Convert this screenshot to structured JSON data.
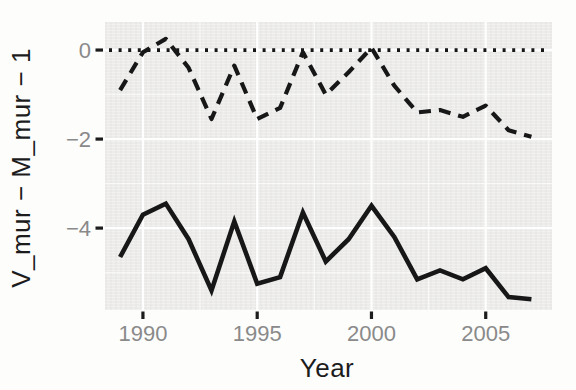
{
  "chart_data": {
    "type": "line",
    "title": "",
    "xlabel": "Year",
    "ylabel": "V_mur − M_mur − 1",
    "legend": "none",
    "grid": "major and minor white gridlines on light gray panel",
    "x": [
      1989,
      1990,
      1991,
      1992,
      1993,
      1994,
      1995,
      1996,
      1997,
      1998,
      1999,
      2000,
      2001,
      2002,
      2003,
      2004,
      2005,
      2006,
      2007
    ],
    "series": [
      {
        "name": "upper-dashed-series",
        "line_style": "dashed",
        "color": "#171717",
        "values": [
          -0.9,
          -0.05,
          0.25,
          -0.4,
          -1.55,
          -0.35,
          -1.55,
          -1.3,
          -0.05,
          -1.0,
          -0.5,
          0.05,
          -0.8,
          -1.4,
          -1.35,
          -1.5,
          -1.25,
          -1.8,
          -1.95
        ]
      },
      {
        "name": "lower-solid-series",
        "line_style": "solid",
        "color": "#171717",
        "values": [
          -4.65,
          -3.7,
          -3.45,
          -4.25,
          -5.4,
          -3.85,
          -5.25,
          -5.1,
          -3.65,
          -4.75,
          -4.25,
          -3.5,
          -4.2,
          -5.15,
          -4.95,
          -5.15,
          -4.9,
          -5.55,
          -5.6
        ]
      }
    ],
    "reference_line": {
      "y": 0,
      "style": "dotted",
      "color": "#171717"
    },
    "x_ticks": {
      "values": [
        1990,
        1995,
        2000,
        2005
      ],
      "labels": [
        "1990",
        "1995",
        "2000",
        "2005"
      ]
    },
    "y_ticks": {
      "values": [
        0,
        -2,
        -4
      ],
      "labels": [
        "0",
        "−2",
        "−4"
      ]
    },
    "x_minor": [
      1992.5,
      1997.5,
      2002.5
    ],
    "y_minor": [
      -1,
      -3,
      -5
    ],
    "xlim": [
      1988.34,
      2007.9
    ],
    "ylim": [
      -5.84,
      0.63
    ],
    "panel_bg": "#f1f0ee",
    "tick_text_color": "#8a8a8a",
    "axis_title_color": "#1c1c1c",
    "line_color": "#171717"
  }
}
